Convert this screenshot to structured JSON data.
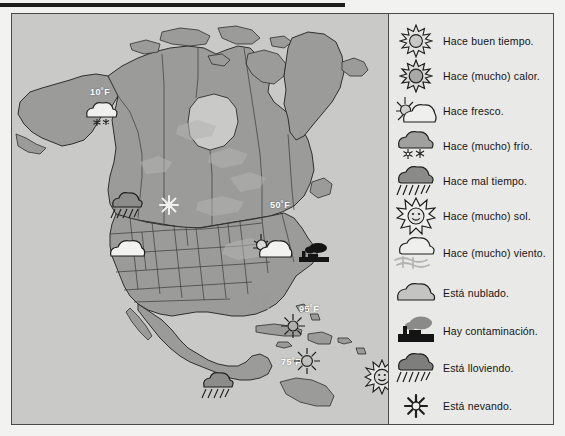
{
  "document": {
    "title": "Mapa del tiempo de Norteamérica",
    "top_rule_color": "#1c1c1c",
    "frame_border_color": "#4a4a4a",
    "map_background_color": "#c9c9c7",
    "land_color": "#9b9b99",
    "legend_background_color": "#e9e9e7"
  },
  "map": {
    "name": "north-america-weather-map",
    "temperature_labels": [
      {
        "id": "alaska-yukon",
        "value": "10˚F",
        "x": 78,
        "y": 73
      },
      {
        "id": "great-lakes",
        "value": "50˚F",
        "x": 258,
        "y": 186
      },
      {
        "id": "caribbean-north",
        "value": "95˚F",
        "x": 287,
        "y": 290
      },
      {
        "id": "caribbean-south",
        "value": "75˚F",
        "x": 269,
        "y": 343
      }
    ],
    "weather_icons": [
      {
        "id": "snow-cloud-yukon",
        "icon": "snow-cloud-icon",
        "x": 68,
        "y": 83,
        "size": 36
      },
      {
        "id": "rain-cloud-northwest",
        "icon": "rain-cloud-icon",
        "x": 95,
        "y": 175,
        "size": 34
      },
      {
        "id": "snowflake-montana",
        "icon": "snowflake-icon",
        "x": 146,
        "y": 180,
        "size": 22
      },
      {
        "id": "cloud-california",
        "icon": "cloud-icon",
        "x": 95,
        "y": 222,
        "size": 36
      },
      {
        "id": "sun-cloud-greatlakes",
        "icon": "sun-behind-cloud-icon",
        "x": 238,
        "y": 218,
        "size": 40
      },
      {
        "id": "factory-northeast",
        "icon": "factory-icon",
        "x": 285,
        "y": 228,
        "size": 32
      },
      {
        "id": "high-pressure",
        "icon": "high-pressure-symbol",
        "x": 237,
        "y": 279,
        "label": "H"
      },
      {
        "id": "sun-florida",
        "icon": "sun-icon",
        "x": 268,
        "y": 299,
        "size": 24
      },
      {
        "id": "sun-cuba",
        "icon": "sun-icon",
        "x": 281,
        "y": 333,
        "size": 26
      },
      {
        "id": "rain-cloud-central",
        "icon": "rain-cloud-icon",
        "x": 186,
        "y": 355,
        "size": 34
      },
      {
        "id": "smiling-sun-atlantic",
        "icon": "smiling-sun-icon",
        "x": 352,
        "y": 345,
        "size": 34
      }
    ]
  },
  "legend": {
    "name": "weather-expressions-legend",
    "items": [
      {
        "icon": "sun-icon",
        "label": "Hace buen tiempo."
      },
      {
        "icon": "bright-sun-icon",
        "label": "Hace (mucho) calor."
      },
      {
        "icon": "sun-behind-cloud-icon",
        "label": "Hace fresco."
      },
      {
        "icon": "snow-cloud-icon",
        "label": "Hace (mucho) frío."
      },
      {
        "icon": "rain-cloud-icon",
        "label": "Hace mal tiempo."
      },
      {
        "icon": "big-sun-icon",
        "label": "Hace (mucho) sol."
      },
      {
        "icon": "wind-cloud-icon",
        "label": "Hace (mucho) viento."
      },
      {
        "icon": "cloud-icon",
        "label": "Está nublado."
      },
      {
        "icon": "factory-icon",
        "label": "Hay contaminación."
      },
      {
        "icon": "rain-cloud-icon",
        "label": "Está lloviendo."
      },
      {
        "icon": "snowflake-icon",
        "label": "Está nevando."
      }
    ]
  }
}
